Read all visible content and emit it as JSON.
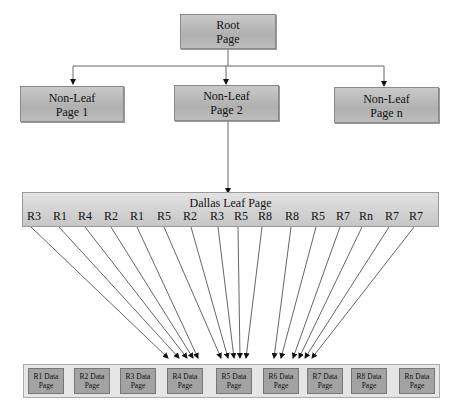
{
  "root": {
    "line1": "Root",
    "line2": "Page"
  },
  "non_leaf": [
    {
      "line1": "Non-Leaf",
      "line2": "Page 1"
    },
    {
      "line1": "Non-Leaf",
      "line2": "Page 2"
    },
    {
      "line1": "Non-Leaf",
      "line2": "Page n"
    }
  ],
  "leaf": {
    "title": "Dallas Leaf Page",
    "refs": [
      "R3",
      "R1",
      "R4",
      "R2",
      "R1",
      "R5",
      "R2",
      "R3",
      "R5",
      "R8",
      "R8",
      "R5",
      "R7",
      "Rn",
      "R7",
      "R7"
    ]
  },
  "data_pages": [
    {
      "line1": "R1 Data",
      "line2": "Page"
    },
    {
      "line1": "R2 Data",
      "line2": "Page"
    },
    {
      "line1": "R3 Data",
      "line2": "Page"
    },
    {
      "line1": "R4 Data",
      "line2": "Page"
    },
    {
      "line1": "R5 Data",
      "line2": "Page"
    },
    {
      "line1": "R6 Data",
      "line2": "Page"
    },
    {
      "line1": "R7 Data",
      "line2": "Page"
    },
    {
      "line1": "R8 Data",
      "line2": "Page"
    },
    {
      "line1": "Rn Data",
      "line2": "Page"
    }
  ]
}
